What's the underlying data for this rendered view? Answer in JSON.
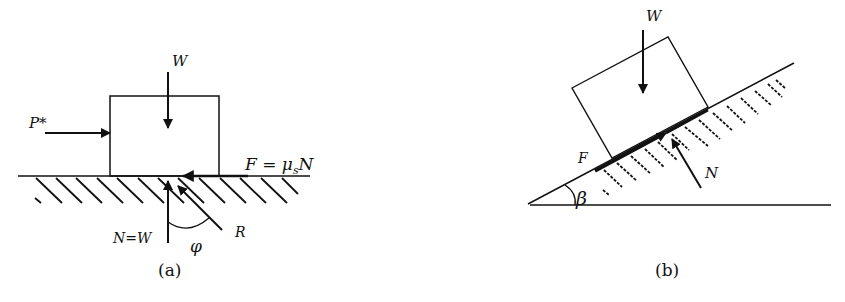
{
  "figure": {
    "panel_a": {
      "caption": "(a)",
      "labels": {
        "weight": "W",
        "push_force": "P*",
        "friction": "F = μ",
        "friction_sub": "s",
        "friction_tail": "N",
        "normal": "N=W",
        "angle": "φ",
        "resultant": "R"
      }
    },
    "panel_b": {
      "caption": "(b)",
      "labels": {
        "weight": "W",
        "friction": "F",
        "normal": "N",
        "angle": "β"
      }
    },
    "colors": {
      "ink": "#111111",
      "background": "#ffffff"
    }
  }
}
